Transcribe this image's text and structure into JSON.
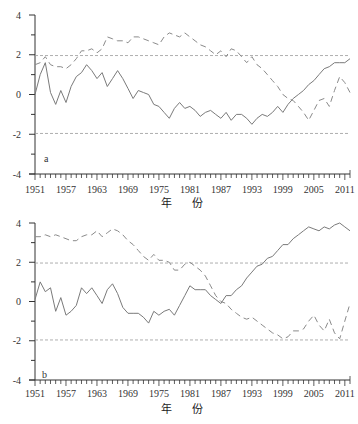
{
  "chart_data": [
    {
      "type": "line",
      "panel": "a",
      "title": "",
      "xlabel": "年 份",
      "ylabel": "",
      "ylim": [
        -4,
        4
      ],
      "yticks": [
        4,
        2,
        0,
        -2,
        -4
      ],
      "xticks": [
        1951,
        1957,
        1963,
        1969,
        1975,
        1981,
        1987,
        1993,
        1999,
        2005,
        2011
      ],
      "xlim": [
        1951,
        2012
      ],
      "grid": false,
      "reference_lines": [
        1.96,
        -1.96
      ],
      "x": [
        1951,
        1952,
        1953,
        1954,
        1955,
        1956,
        1957,
        1958,
        1959,
        1960,
        1961,
        1962,
        1963,
        1964,
        1965,
        1966,
        1967,
        1968,
        1969,
        1970,
        1971,
        1972,
        1973,
        1974,
        1975,
        1976,
        1977,
        1978,
        1979,
        1980,
        1981,
        1982,
        1983,
        1984,
        1985,
        1986,
        1987,
        1988,
        1989,
        1990,
        1991,
        1992,
        1993,
        1994,
        1995,
        1996,
        1997,
        1998,
        1999,
        2000,
        2001,
        2002,
        2003,
        2004,
        2005,
        2006,
        2007,
        2008,
        2009,
        2010,
        2011,
        2012
      ],
      "series": [
        {
          "name": "UF",
          "style": "solid",
          "values": [
            0.0,
            1.0,
            1.6,
            0.1,
            -0.5,
            0.2,
            -0.4,
            0.4,
            0.9,
            1.1,
            1.5,
            1.2,
            0.8,
            1.1,
            0.4,
            0.8,
            1.2,
            0.8,
            0.3,
            -0.2,
            0.2,
            0.1,
            0.0,
            -0.5,
            -0.6,
            -0.9,
            -1.2,
            -0.7,
            -0.4,
            -0.7,
            -0.6,
            -0.8,
            -1.1,
            -0.9,
            -0.8,
            -1.0,
            -1.2,
            -0.9,
            -1.3,
            -1.0,
            -1.0,
            -1.2,
            -1.5,
            -1.2,
            -1.0,
            -1.1,
            -0.9,
            -0.6,
            -0.9,
            -0.5,
            -0.2,
            0.0,
            0.2,
            0.5,
            0.7,
            1.0,
            1.3,
            1.4,
            1.6,
            1.6,
            1.6,
            1.8
          ]
        },
        {
          "name": "UB",
          "style": "dashed",
          "values": [
            1.5,
            1.6,
            1.9,
            1.5,
            1.4,
            1.4,
            1.3,
            1.5,
            1.8,
            2.2,
            2.2,
            2.3,
            2.1,
            2.3,
            2.9,
            2.8,
            2.7,
            2.7,
            2.6,
            2.9,
            2.9,
            2.8,
            2.7,
            2.6,
            2.5,
            2.9,
            3.1,
            3.0,
            2.9,
            3.1,
            2.9,
            2.7,
            2.5,
            2.4,
            2.2,
            2.0,
            2.2,
            1.9,
            2.3,
            2.2,
            1.9,
            1.6,
            1.9,
            1.5,
            1.3,
            1.0,
            0.7,
            0.4,
            0.0,
            -0.2,
            -0.3,
            -0.6,
            -0.9,
            -1.3,
            -0.8,
            -0.3,
            -0.2,
            -0.6,
            0.2,
            0.9,
            0.6,
            0.1
          ]
        }
      ]
    },
    {
      "type": "line",
      "panel": "b",
      "title": "",
      "xlabel": "年 份",
      "ylabel": "",
      "ylim": [
        -4,
        4
      ],
      "yticks": [
        4,
        2,
        0,
        -2,
        -4
      ],
      "xticks": [
        1951,
        1957,
        1963,
        1969,
        1975,
        1981,
        1987,
        1993,
        1999,
        2005,
        2011
      ],
      "xlim": [
        1951,
        2012
      ],
      "grid": false,
      "reference_lines": [
        1.96,
        -1.96
      ],
      "x": [
        1951,
        1952,
        1953,
        1954,
        1955,
        1956,
        1957,
        1958,
        1959,
        1960,
        1961,
        1962,
        1963,
        1964,
        1965,
        1966,
        1967,
        1968,
        1969,
        1970,
        1971,
        1972,
        1973,
        1974,
        1975,
        1976,
        1977,
        1978,
        1979,
        1980,
        1981,
        1982,
        1983,
        1984,
        1985,
        1986,
        1987,
        1988,
        1989,
        1990,
        1991,
        1992,
        1993,
        1994,
        1995,
        1996,
        1997,
        1998,
        1999,
        2000,
        2001,
        2002,
        2003,
        2004,
        2005,
        2006,
        2007,
        2008,
        2009,
        2010,
        2011,
        2012
      ],
      "series": [
        {
          "name": "UF",
          "style": "solid",
          "values": [
            0.1,
            1.0,
            0.5,
            0.7,
            -0.5,
            0.2,
            -0.7,
            -0.5,
            -0.2,
            0.7,
            0.4,
            0.7,
            0.3,
            -0.1,
            0.6,
            0.9,
            0.4,
            -0.3,
            -0.6,
            -0.6,
            -0.6,
            -0.8,
            -1.1,
            -0.5,
            -0.7,
            -0.5,
            -0.4,
            -0.7,
            -0.2,
            0.3,
            0.8,
            0.6,
            0.6,
            0.6,
            0.3,
            0.1,
            -0.1,
            0.3,
            0.3,
            0.6,
            0.8,
            1.2,
            1.5,
            1.8,
            1.9,
            2.2,
            2.3,
            2.6,
            2.9,
            2.9,
            3.2,
            3.4,
            3.6,
            3.8,
            3.7,
            3.6,
            3.8,
            3.7,
            3.9,
            4.0,
            3.8,
            3.6
          ]
        },
        {
          "name": "UB",
          "style": "dashed",
          "values": [
            3.3,
            3.3,
            3.4,
            3.3,
            3.4,
            3.3,
            3.2,
            3.1,
            3.1,
            3.3,
            3.4,
            3.4,
            3.6,
            3.3,
            3.5,
            3.7,
            3.6,
            3.4,
            3.1,
            2.9,
            2.6,
            2.3,
            2.1,
            2.4,
            2.1,
            2.1,
            2.0,
            1.6,
            1.6,
            1.9,
            2.0,
            1.8,
            1.6,
            1.3,
            0.8,
            0.3,
            0.0,
            -0.1,
            -0.4,
            -0.6,
            -0.8,
            -0.9,
            -0.8,
            -1.0,
            -1.2,
            -1.4,
            -1.6,
            -1.7,
            -1.9,
            -1.8,
            -1.5,
            -1.5,
            -1.4,
            -1.0,
            -0.7,
            -1.2,
            -1.5,
            -0.9,
            -1.6,
            -1.9,
            -1.0,
            -0.1
          ]
        }
      ]
    }
  ],
  "panels": [
    {
      "label": "a",
      "xlabel": "年 份"
    },
    {
      "label": "b",
      "xlabel": "年 份"
    }
  ],
  "colors": {
    "uf_line": "#7a7a7a",
    "ub_line": "#8a8a8a",
    "ref_line": "#9a9a9a",
    "axis": "#333333"
  }
}
